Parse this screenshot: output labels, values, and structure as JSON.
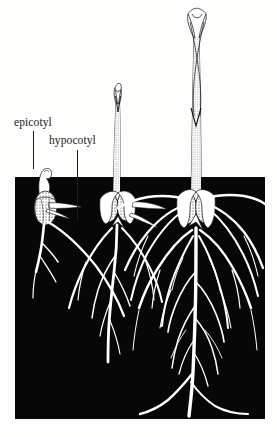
{
  "figure": {
    "background_color": "#fdfdfb",
    "soil_color": "#070707",
    "plant_color": "#ffffff",
    "ink_color": "#1a1a1a",
    "width": 277,
    "height": 437
  },
  "labels": {
    "epicotyl": "epicotyl",
    "hypocotyl": "hypocotyl"
  },
  "soil": {
    "name": "soil-block",
    "x": 15,
    "y": 177,
    "width": 250,
    "height": 242
  },
  "stages": [
    {
      "name": "seedling-stage-1",
      "description": "earliest stage, hooked shoot just above soil, short primary root",
      "shoot_top_y": 168,
      "seed_center_x": 46,
      "seed_center_y": 205
    },
    {
      "name": "seedling-stage-2",
      "description": "intermediate stage, elongated shoot with unfurling leaves, branching roots",
      "shoot_top_y": 95,
      "seed_center_x": 117,
      "seed_center_y": 205
    },
    {
      "name": "seedling-stage-3",
      "description": "most developed stage, tall shoot with long leaves, extensive fibrous root system",
      "shoot_top_y": 22,
      "seed_center_x": 196,
      "seed_center_y": 205
    }
  ],
  "leaders": [
    {
      "name": "leader-line-epicotyl",
      "x": 33,
      "y1": 131,
      "y2": 169
    },
    {
      "name": "leader-line-hypocotyl",
      "x": 77,
      "y1": 150,
      "y2": 221
    }
  ]
}
